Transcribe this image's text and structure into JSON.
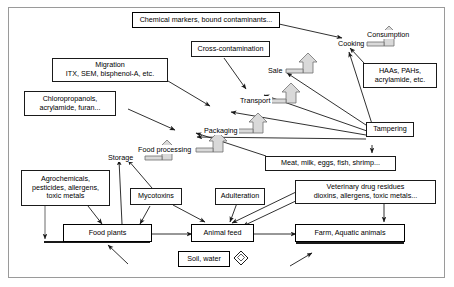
{
  "diagram": {
    "nodes": {
      "chemical_markers": {
        "lines": [
          "Chemical markers, bound contaminants..."
        ]
      },
      "cross_contamination": {
        "lines": [
          "Cross-contamination"
        ]
      },
      "migration": {
        "lines": [
          "Migration",
          "ITX, SEM, bisphenol-A, etc."
        ]
      },
      "chloropropanols": {
        "lines": [
          "Chloropropanols,",
          "acrylamide, furan..."
        ]
      },
      "haas_pahs": {
        "lines": [
          "HAAs, PAHs,",
          "acrylamide, etc."
        ]
      },
      "tampering": {
        "lines": [
          "Tampering"
        ]
      },
      "meat_milk": {
        "lines": [
          "Meat, milk, eggs, fish, shrimp..."
        ]
      },
      "veterinary": {
        "lines": [
          "Veterinary drug residues",
          "dioxins, allergens, toxic metals..."
        ]
      },
      "agrochemicals": {
        "lines": [
          "Agrochemicals,",
          "pesticides, allergens,",
          "toxic metals"
        ]
      },
      "mycotoxins": {
        "lines": [
          "Mycotoxins"
        ]
      },
      "adulteration": {
        "lines": [
          "Adulteration"
        ]
      },
      "food_plants": {
        "lines": [
          "Food plants"
        ]
      },
      "animal_feed": {
        "lines": [
          "Animal feed"
        ]
      },
      "farm_aquatic": {
        "lines": [
          "Farm, Aquatic animals"
        ]
      },
      "soil_water": {
        "lines": [
          "Soil, water"
        ]
      }
    },
    "stages": {
      "consumption": "Consumption",
      "cooking": "Cooking",
      "sale": "Sale",
      "transport": "Transport",
      "packaging": "Packaging",
      "food_processing": "Food processing",
      "storage": "Storage"
    },
    "icons": {
      "block_arrow": "block-arrow-icon",
      "diamond": "diamond-marker-icon"
    },
    "colors": {
      "line": "#1a1a1a",
      "frame": "#9a9a9a",
      "arrow_fill": "#d9d9d9",
      "background": "#ffffff"
    }
  }
}
